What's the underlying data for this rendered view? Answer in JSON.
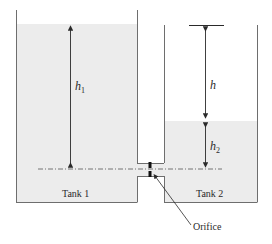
{
  "figure": {
    "type": "two-tank orifice diagram",
    "labels": {
      "tank1": "Tank 1",
      "tank2": "Tank 2",
      "orifice": "Orifice",
      "h1_main": "h",
      "h1_sub": "1",
      "h": "h",
      "h2_main": "h",
      "h2_sub": "2"
    },
    "colors": {
      "water": "#ececec",
      "wall": "#6e6e6e",
      "line": "#3a3a3a",
      "datum": "#555555",
      "orifice": "#111111"
    }
  }
}
